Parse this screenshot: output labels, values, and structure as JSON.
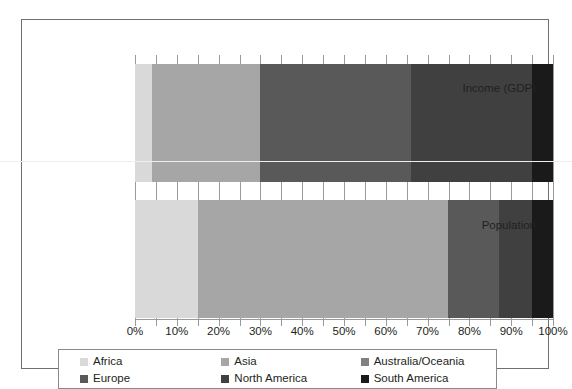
{
  "chart_data": {
    "type": "bar",
    "orientation": "horizontal",
    "stacked": true,
    "normalized": "100%",
    "title": "",
    "subtitle": "",
    "xlabel": "",
    "ylabel": "",
    "xlim": [
      0,
      100
    ],
    "grid": false,
    "legend_position": "bottom",
    "categories": [
      "Income (GDP)",
      "Population"
    ],
    "x_tick_labels": [
      "0%",
      "10%",
      "20%",
      "30%",
      "40%",
      "50%",
      "60%",
      "70%",
      "80%",
      "90%",
      "100%"
    ],
    "x_tick_values": [
      0,
      10,
      20,
      30,
      40,
      50,
      60,
      70,
      80,
      90,
      100
    ],
    "x_minor_tick_step": 5,
    "series": [
      {
        "name": "Africa",
        "color": "#d9d9d9",
        "values": [
          4,
          15
        ]
      },
      {
        "name": "Asia",
        "color": "#a6a6a6",
        "values": [
          26,
          60
        ]
      },
      {
        "name": "Australia/Oceania",
        "color": "#808080",
        "values": [
          0,
          0
        ]
      },
      {
        "name": "Europe",
        "color": "#595959",
        "values": [
          36,
          12
        ]
      },
      {
        "name": "North America",
        "color": "#404040",
        "values": [
          29,
          8
        ]
      },
      {
        "name": "South America",
        "color": "#1a1a1a",
        "values": [
          5,
          5
        ]
      }
    ]
  },
  "legend": {
    "rows": [
      [
        "Africa",
        "Asia",
        "Australia/Oceania"
      ],
      [
        "Europe",
        "North America",
        "South America"
      ]
    ]
  }
}
